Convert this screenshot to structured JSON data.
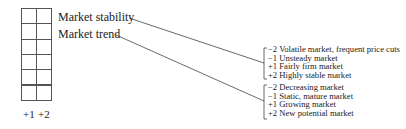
{
  "grid": {
    "rows": 6,
    "columns": 2,
    "column_labels": [
      "+1",
      "+2"
    ]
  },
  "criteria": [
    {
      "label": "Market stability",
      "options": [
        "−2 Volatile market, frequent price cuts",
        "−1 Unsteady market",
        "+1 Fairly firm market",
        "+2 Highly stable market"
      ]
    },
    {
      "label": "Market trend",
      "options": [
        "−2 Decreasing market",
        "−1 Static, mature market",
        "+1 Growing market",
        "+2 New potential market"
      ]
    }
  ]
}
